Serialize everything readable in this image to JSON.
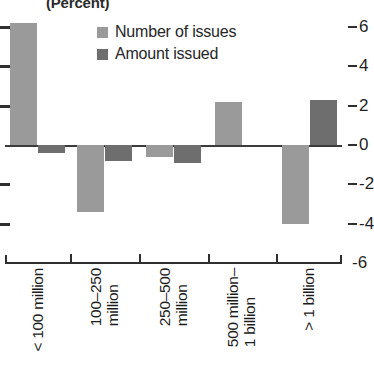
{
  "chart_data": {
    "type": "bar",
    "title": "(Percent)",
    "xlabel": "",
    "ylabel": "",
    "ylim": [
      -6,
      6
    ],
    "yticks": [
      6,
      4,
      2,
      0,
      -2,
      -4,
      -6
    ],
    "ytick_labels": [
      "6",
      "4",
      "2",
      "0",
      "-2",
      "-4",
      "-6"
    ],
    "grid": false,
    "legend_position": "top-center",
    "categories": [
      "< 100 million",
      "100–250 million",
      "250–500 million",
      "500 million–1 billion",
      "> 1 billion"
    ],
    "series": [
      {
        "name": "Number of issues",
        "color": "#9a9a9a",
        "values": [
          6.2,
          -3.4,
          -0.6,
          2.2,
          -4.0
        ]
      },
      {
        "name": "Amount issued",
        "color": "#6e6e6e",
        "values": [
          -0.4,
          -0.8,
          -0.9,
          0.0,
          2.3
        ]
      }
    ]
  },
  "axis": {
    "left_ticks": [
      "",
      "",
      "",
      "",
      "",
      "",
      ""
    ],
    "right_tick_labels": [
      "6",
      "4",
      "2",
      "0",
      "-2",
      "-4",
      "-6"
    ]
  },
  "legend": {
    "items": [
      {
        "label": "Number of issues",
        "swatch": "#9a9a9a"
      },
      {
        "label": "Amount issued",
        "swatch": "#6e6e6e"
      }
    ]
  },
  "categories_multiline": [
    {
      "line1": "< 100 million",
      "line2": ""
    },
    {
      "line1": "100–250",
      "line2": "million"
    },
    {
      "line1": "250–500",
      "line2": "million"
    },
    {
      "line1": "500 million–",
      "line2": "1 billion"
    },
    {
      "line1": "> 1 billion",
      "line2": ""
    }
  ],
  "colors": {
    "series_light": "#9a9a9a",
    "series_dark": "#6e6e6e",
    "axis": "#2f2f2f",
    "text": "#1b1b1b",
    "background": "#ffffff"
  }
}
